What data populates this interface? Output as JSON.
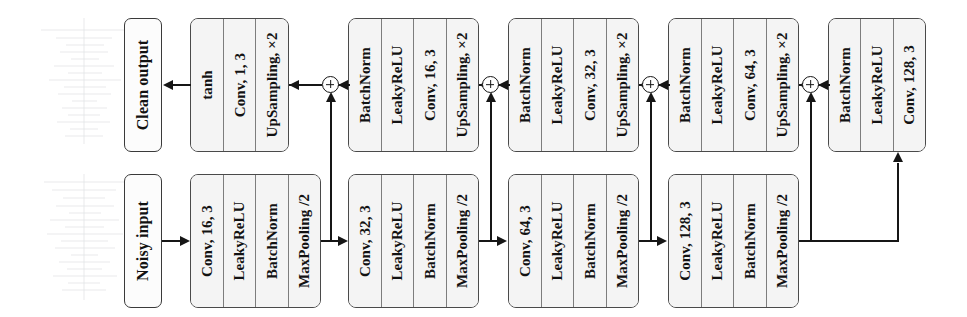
{
  "figure": {
    "orientation": "text rotated 90 degrees counter-clockwise",
    "colors": {
      "stroke": "#161616",
      "block_fill": "#f4f4f4",
      "block_border": "#4a4a4a",
      "endbox_fill": "#fcfcfc",
      "waveform": "#9aa0a6"
    }
  },
  "endpoints": {
    "output": {
      "label": "Clean output"
    },
    "input": {
      "label": "Noisy input"
    }
  },
  "encoder": {
    "stages": [
      {
        "cells": [
          "Conv, 16, 3",
          "LeakyReLU",
          "BatchNorm",
          "MaxPooling /2"
        ]
      },
      {
        "cells": [
          "Conv, 32, 3",
          "LeakyReLU",
          "BatchNorm",
          "MaxPooling /2"
        ]
      },
      {
        "cells": [
          "Conv, 64, 3",
          "LeakyReLU",
          "BatchNorm",
          "MaxPooling /2"
        ]
      },
      {
        "cells": [
          "Conv, 128, 3",
          "LeakyReLU",
          "BatchNorm",
          "MaxPooling /2"
        ]
      }
    ]
  },
  "decoder": {
    "stages": [
      {
        "cells": [
          "tanh",
          "Conv, 1, 3",
          "UpSampling, ×2"
        ]
      },
      {
        "cells": [
          "BatchNorm",
          "LeakyReLU",
          "Conv, 16, 3",
          "UpSampling, ×2"
        ]
      },
      {
        "cells": [
          "BatchNorm",
          "LeakyReLU",
          "Conv, 32, 3",
          "UpSampling, ×2"
        ]
      },
      {
        "cells": [
          "BatchNorm",
          "LeakyReLU",
          "Conv, 64, 3",
          "UpSampling, ×2"
        ]
      }
    ]
  },
  "bottleneck": {
    "cells": [
      "BatchNorm",
      "LeakyReLU",
      "Conv, 128, 3"
    ]
  },
  "nodes": {
    "add_symbol": "+",
    "add_count": 4
  }
}
